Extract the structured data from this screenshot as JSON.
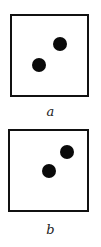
{
  "figures": [
    {
      "label": "a",
      "box": {
        "x": 10,
        "y": 14,
        "w": 79,
        "h": 83
      },
      "dots": [
        {
          "cx": 60,
          "cy": 44,
          "r": 7
        },
        {
          "cx": 39,
          "cy": 65,
          "r": 7
        }
      ],
      "label_y": 104
    },
    {
      "label": "b",
      "box": {
        "x": 8,
        "y": 129,
        "w": 81,
        "h": 83
      },
      "dots": [
        {
          "cx": 67,
          "cy": 152,
          "r": 7
        },
        {
          "cx": 49,
          "cy": 171,
          "r": 7
        }
      ],
      "label_y": 222
    }
  ]
}
